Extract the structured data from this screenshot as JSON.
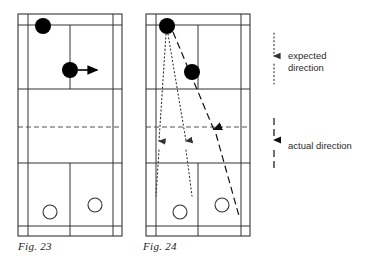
{
  "figure": {
    "captions": {
      "left": "Fig. 23",
      "right": "Fig. 24"
    }
  },
  "legend": {
    "items": [
      {
        "key": "expected",
        "icon": "dotted-down-arrow-icon",
        "line_style": "dotted",
        "label_line1": "expected",
        "label_line2": "direction",
        "color": "#4a4a4a"
      },
      {
        "key": "actual",
        "icon": "dashed-down-arrow-icon",
        "line_style": "dashed",
        "label_line1": "actual direction",
        "label_line2": "",
        "color": "#1a1a1a"
      }
    ]
  },
  "courts": [
    {
      "id": "court-left",
      "caption": "Fig. 23",
      "players_filled": [
        {
          "name": "attacker-top-left",
          "cx": 43,
          "cy": 26,
          "r": 8
        },
        {
          "name": "attacker-mid",
          "cx": 70,
          "cy": 70,
          "r": 8
        }
      ],
      "players_open": [
        {
          "name": "defender-left",
          "cx": 50,
          "cy": 212,
          "r": 7
        },
        {
          "name": "defender-right",
          "cx": 95,
          "cy": 205,
          "r": 7
        }
      ],
      "arrows": [
        {
          "name": "movement-arrow",
          "x1": 78,
          "y1": 70,
          "x2": 99,
          "y2": 70
        }
      ],
      "expected_paths": [],
      "actual_paths": []
    },
    {
      "id": "court-right",
      "caption": "Fig. 24",
      "players_filled": [
        {
          "name": "attacker-top-left",
          "cx": 167,
          "cy": 26,
          "r": 8
        },
        {
          "name": "attacker-mid",
          "cx": 192,
          "cy": 72,
          "r": 8
        }
      ],
      "players_open": [
        {
          "name": "defender-left",
          "cx": 178,
          "cy": 212,
          "r": 7
        },
        {
          "name": "defender-right",
          "cx": 222,
          "cy": 205,
          "r": 7
        }
      ],
      "arrows": [],
      "expected_paths": [
        {
          "name": "expected-path-straight",
          "x1": 167,
          "y1": 34,
          "x2": 159,
          "y2": 143
        },
        {
          "name": "expected-path-cross",
          "x1": 167,
          "y1": 34,
          "x2": 186,
          "y2": 143
        }
      ],
      "actual_paths": [
        {
          "name": "actual-path",
          "x1": 174,
          "y1": 32,
          "x2": 239,
          "y2": 216
        }
      ]
    }
  ],
  "court_geometry": {
    "line_color": "#333333",
    "net_color": "#555555",
    "note": "standard badminton court: outer boundary, side tramlines, service lines, centre line, net at mid"
  },
  "colors": {
    "player_filled": "#000000",
    "player_open_stroke": "#333333",
    "court_line": "#333333",
    "expected": "#4a4a4a",
    "actual": "#1a1a1a",
    "background": "#ffffff"
  }
}
